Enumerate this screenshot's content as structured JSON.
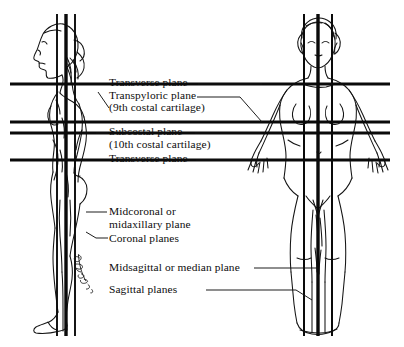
{
  "figure": {
    "background_color": "#ffffff",
    "ink_color": "#111111",
    "views": [
      {
        "name": "lateral-view-figure",
        "description": "Side (lateral) view of standing female figure facing left",
        "x": 28,
        "y": 18,
        "width": 80,
        "height": 310
      },
      {
        "name": "anterior-view-figure",
        "description": "Front (anterior) view of standing female figure with arms abducted",
        "x": 258,
        "y": 18,
        "width": 120,
        "height": 312
      }
    ],
    "signature": "artist-signature"
  },
  "labels": {
    "transverse_upper": "Transverse plane",
    "transpyloric": "Transpyloric plane",
    "transpyloric_sub": "(9th costal cartilage)",
    "subcostal": "Subcostal plane",
    "subcostal_sub": "(10th costal cartilage)",
    "transverse_lower": "Transverse plane",
    "midcoronal": "Midcoronal or",
    "midcoronal_sub": "midaxillary plane",
    "coronal": "Coronal planes",
    "midsagittal": "Midsagittal or median plane",
    "sagittal": "Sagittal planes"
  },
  "planes": {
    "horizontal": [
      {
        "name": "transverse-plane-upper-line",
        "y": 84,
        "x1": 10,
        "x2": 390,
        "thickness": 3.2
      },
      {
        "name": "transpyloric-plane-line",
        "y": 122,
        "x1": 10,
        "x2": 390,
        "thickness": 3.2
      },
      {
        "name": "subcostal-plane-line",
        "y": 133,
        "x1": 10,
        "x2": 390,
        "thickness": 3.2
      },
      {
        "name": "transverse-plane-lower-line",
        "y": 160,
        "x1": 10,
        "x2": 390,
        "thickness": 3.2
      }
    ],
    "vertical_lateral": [
      {
        "name": "coronal-plane-anterior-line",
        "x": 57,
        "y1": 14,
        "y2": 336,
        "thickness": 1.9
      },
      {
        "name": "midcoronal-plane-line",
        "x": 66,
        "y1": 14,
        "y2": 336,
        "thickness": 3.4
      },
      {
        "name": "coronal-plane-posterior-line",
        "x": 75,
        "y1": 14,
        "y2": 336,
        "thickness": 1.9
      }
    ],
    "vertical_anterior": [
      {
        "name": "sagittal-plane-left-line",
        "x": 304,
        "y1": 14,
        "y2": 336,
        "thickness": 2.0
      },
      {
        "name": "midsagittal-plane-line",
        "x": 318,
        "y1": 14,
        "y2": 336,
        "thickness": 3.4
      },
      {
        "name": "sagittal-plane-right-line",
        "x": 332,
        "y1": 14,
        "y2": 336,
        "thickness": 2.0
      }
    ]
  }
}
